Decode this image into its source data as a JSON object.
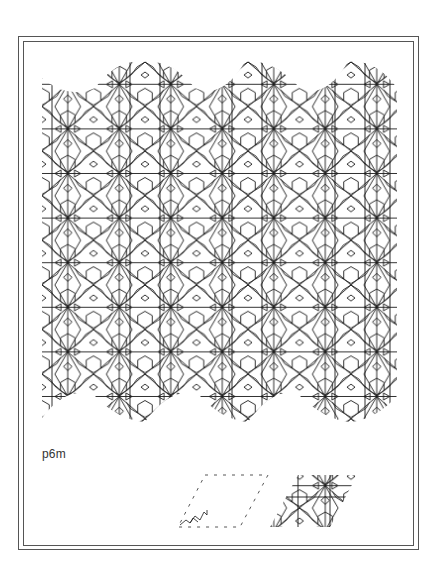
{
  "figure": {
    "group_label": "p6m",
    "colors": {
      "line": "#1a1a1a",
      "frame": "#555555",
      "background": "#ffffff",
      "dashed": "#444444"
    },
    "pattern": {
      "description": "interlaced geometric star pattern with six-fold rotational and mirror symmetry",
      "left": 42,
      "right": 397,
      "top_peaks_x": [
        143,
        245,
        348
      ],
      "bottom_dips_x": [
        145,
        248,
        350
      ]
    },
    "unit_cell_outline": {
      "style": "dashed",
      "shape": "rhombus"
    },
    "unit_cell_filled": {
      "style": "filled-with-motif",
      "shape": "rhombus"
    }
  }
}
